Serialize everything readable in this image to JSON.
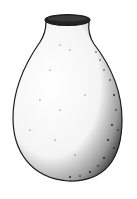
{
  "image": {
    "subject": "Stippled ink drawing of a ceramic jar",
    "colors": {
      "background": "#ffffff",
      "ink": "#1a1a1a"
    }
  }
}
